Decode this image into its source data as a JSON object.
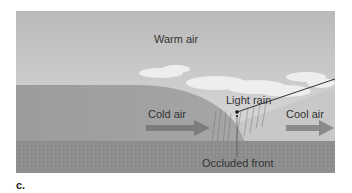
{
  "figure": {
    "panel_label": "c.",
    "labels": {
      "warm_air": "Warm air",
      "light_rain": "Light rain",
      "cold_air": "Cold air",
      "cool_air": "Cool air",
      "occluded_front": "Occluded front"
    },
    "colors": {
      "sky_top": "#bdbdbd",
      "sky_bottom": "#e2e2e2",
      "cold_air_mass": "#9a9a9a",
      "cool_air_mass": "#c6c6c6",
      "ground": "#8c8c8c",
      "arrow": "#7a7a7a",
      "text": "#333333"
    }
  }
}
